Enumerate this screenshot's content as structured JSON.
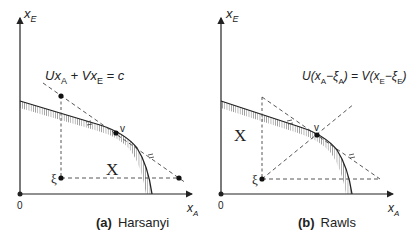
{
  "panels": [
    {
      "id": "a",
      "caption_tag": "(a)",
      "caption_name": "Harsanyi",
      "y_axis_label": "x",
      "y_axis_sub": "E",
      "x_axis_label": "x",
      "x_axis_sub": "A",
      "origin_label": "0",
      "region_label": "X",
      "point_v_label": "v",
      "point_xi_label": "ξ",
      "equation": {
        "p1": "Ux",
        "s1": "A",
        "p2": " + Vx",
        "s2": "E",
        "p3": " = c"
      }
    },
    {
      "id": "b",
      "caption_tag": "(b)",
      "caption_name": "Rawls",
      "y_axis_label": "x",
      "y_axis_sub": "E",
      "x_axis_label": "x",
      "x_axis_sub": "A",
      "origin_label": "0",
      "region_label": "X",
      "point_v_label": "v",
      "point_xi_label": "ξ",
      "equation": {
        "p1": "U(x",
        "s1": "A",
        "p2": "−ξ",
        "s2": "A",
        "p3": ") = V(x",
        "s3": "E",
        "p4": "−ξ",
        "s4": "E",
        "p5": ")"
      }
    }
  ],
  "colors": {
    "ink": "#222222",
    "dash": "#444444",
    "background": "#ffffff"
  }
}
